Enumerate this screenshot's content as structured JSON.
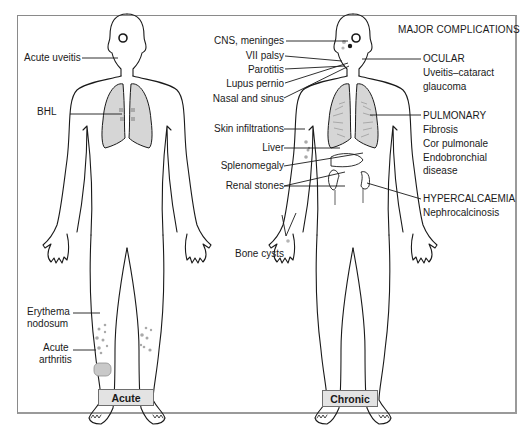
{
  "diagram": {
    "title": "MAJOR COMPLICATIONS",
    "figures": [
      {
        "id": "acute",
        "caption": "Acute"
      },
      {
        "id": "chronic",
        "caption": "Chronic"
      }
    ],
    "acute_labels": {
      "acute_uveitis": "Acute uveitis",
      "bhl": "BHL",
      "erythema_nodosum_1": "Erythema",
      "erythema_nodosum_2": "nodosum",
      "acute_arthritis_1": "Acute",
      "acute_arthritis_2": "arthritis"
    },
    "chronic_left_labels": {
      "cns": "CNS, meninges",
      "vii_palsy": "VII palsy",
      "parotitis": "Parotitis",
      "lupus_pernio": "Lupus pernio",
      "nasal_sinus": "Nasal and sinus",
      "skin": "Skin infiltrations",
      "liver": "Liver",
      "splenomegaly": "Splenomegaly",
      "renal_stones": "Renal stones",
      "bone_cysts": "Bone cysts"
    },
    "chronic_right_groups": {
      "ocular": {
        "heading": "OCULAR",
        "items": [
          "Uveitis–cataract",
          "glaucoma"
        ]
      },
      "pulmonary": {
        "heading": "PULMONARY",
        "items": [
          "Fibrosis",
          "Cor pulmonale",
          "Endobronchial",
          "disease"
        ]
      },
      "hypercalcaemia": {
        "heading": "HYPERCALCAEMIA",
        "items": [
          "Nephrocalcinosis"
        ]
      }
    },
    "colors": {
      "outline": "#1a1a1a",
      "lung_fill": "#d6d6d6",
      "lesion_fill": "#a9a9a9",
      "caption_fill": "#e3e3e3",
      "frame": "#8a8a8a"
    }
  }
}
